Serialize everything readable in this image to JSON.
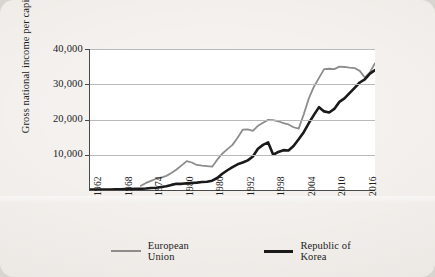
{
  "figure": {
    "background_color": "#efebe7",
    "plot_background_color": "#ffffff"
  },
  "chart_data": {
    "type": "line",
    "title": "",
    "xlabel": "",
    "ylabel": "Gross national income per capita (US$)",
    "xlim": [
      1962,
      2018
    ],
    "ylim": [
      0,
      40000
    ],
    "grid": true,
    "gridlines_y": [
      10000,
      20000,
      30000,
      40000
    ],
    "legend_position": "bottom",
    "xticks": [
      1962,
      1968,
      1974,
      1980,
      1986,
      1992,
      1998,
      2004,
      2010,
      2016
    ],
    "xtick_labels": [
      "1962",
      "1968",
      "1974",
      "1980",
      "1986",
      "1992",
      "1998",
      "2004",
      "2010",
      "2016"
    ],
    "yticks": [
      10000,
      20000,
      30000,
      40000
    ],
    "ytick_labels": [
      "10,000",
      "20,000",
      "30,000",
      "40,000"
    ],
    "series": [
      {
        "name": "European Union",
        "color": "#8d8d8d",
        "line_width": 1.8,
        "x": [
          1972,
          1973,
          1974,
          1975,
          1976,
          1977,
          1978,
          1979,
          1980,
          1981,
          1982,
          1983,
          1984,
          1985,
          1986,
          1987,
          1988,
          1989,
          1990,
          1991,
          1992,
          1993,
          1994,
          1995,
          1996,
          1997,
          1998,
          1999,
          2000,
          2001,
          2002,
          2003,
          2004,
          2005,
          2006,
          2007,
          2008,
          2009,
          2010,
          2011,
          2012,
          2013,
          2014,
          2015,
          2016,
          2017,
          2018
        ],
        "values": [
          1200,
          2000,
          2600,
          3200,
          3500,
          4000,
          4800,
          5800,
          7000,
          8200,
          7800,
          7100,
          6900,
          6800,
          6600,
          8600,
          10300,
          11600,
          12800,
          14800,
          17100,
          17200,
          16800,
          18200,
          19100,
          19900,
          19800,
          19500,
          19000,
          18600,
          17800,
          17400,
          21500,
          26000,
          29300,
          31800,
          34300,
          34400,
          34300,
          35000,
          34900,
          34700,
          34600,
          33800,
          31900,
          33400,
          36000
        ]
      },
      {
        "name": "Republic of Korea",
        "color": "#1a1a1a",
        "line_width": 2.6,
        "x": [
          1962,
          1963,
          1964,
          1965,
          1966,
          1967,
          1968,
          1969,
          1970,
          1971,
          1972,
          1973,
          1974,
          1975,
          1976,
          1977,
          1978,
          1979,
          1980,
          1981,
          1982,
          1983,
          1984,
          1985,
          1986,
          1987,
          1988,
          1989,
          1990,
          1991,
          1992,
          1993,
          1994,
          1995,
          1996,
          1997,
          1998,
          1999,
          2000,
          2001,
          2002,
          2003,
          2004,
          2005,
          2006,
          2007,
          2008,
          2009,
          2010,
          2011,
          2012,
          2013,
          2014,
          2015,
          2016,
          2017,
          2018
        ],
        "values": [
          120,
          150,
          130,
          120,
          150,
          180,
          220,
          280,
          300,
          320,
          350,
          430,
          580,
          640,
          860,
          1080,
          1450,
          1780,
          1750,
          1890,
          2000,
          2100,
          2250,
          2350,
          2650,
          3400,
          4600,
          5600,
          6500,
          7300,
          7800,
          8400,
          9500,
          11700,
          12800,
          13500,
          10000,
          10800,
          11300,
          11200,
          12500,
          14400,
          16400,
          19000,
          21300,
          23500,
          22300,
          22000,
          23000,
          25000,
          26000,
          27500,
          29000,
          30500,
          31400,
          33000,
          34000
        ]
      }
    ]
  },
  "legend": {
    "items": [
      {
        "label": "European Union",
        "color": "#8d8d8d"
      },
      {
        "label": "Republic of Korea",
        "color": "#1a1a1a"
      }
    ]
  }
}
